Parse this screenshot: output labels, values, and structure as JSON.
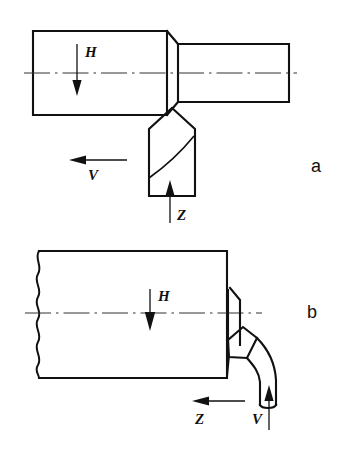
{
  "figure": {
    "kind": "technical-line-drawing",
    "background_color": "#ffffff",
    "line_color": "#111111"
  },
  "panels": [
    {
      "id": "a",
      "panel_label": "a",
      "label_position": {
        "x": 311,
        "y": 172
      },
      "description": "stepped cylindrical workpiece with cutting tool below, turning operation",
      "annotations": [
        {
          "name": "force-H",
          "label": "H",
          "direction": "down",
          "label_x": 85,
          "label_y": 57,
          "line": {
            "x1": 77,
            "y1": 44,
            "x2": 77,
            "y2": 86
          },
          "head": {
            "x": 77,
            "y": 95
          }
        },
        {
          "name": "velocity-V",
          "label": "V",
          "direction": "left",
          "label_x": 88,
          "label_y": 180,
          "line": {
            "x1": 126,
            "y1": 160,
            "x2": 84,
            "y2": 160
          },
          "head": {
            "x": 70,
            "y": 160
          }
        },
        {
          "name": "force-Z",
          "label": "Z",
          "direction": "up",
          "label_x": 177,
          "label_y": 219,
          "line": {
            "x1": 170,
            "y1": 222,
            "x2": 170,
            "y2": 193
          },
          "head": {
            "x": 170,
            "y": 181
          }
        }
      ],
      "centerline": {
        "x1": 24,
        "y1": 73,
        "x2": 297,
        "y2": 73
      }
    },
    {
      "id": "b",
      "panel_label": "b",
      "label_position": {
        "x": 307,
        "y": 318
      },
      "description": "large workpiece with break line at left and form cutting tool at right, facing operation",
      "annotations": [
        {
          "name": "force-H",
          "label": "H",
          "direction": "down",
          "label_x": 158,
          "label_y": 300,
          "line": {
            "x1": 150,
            "y1": 290,
            "x2": 150,
            "y2": 318
          },
          "head": {
            "x": 150,
            "y": 328
          }
        },
        {
          "name": "force-Z",
          "label": "Z",
          "direction": "left",
          "label_x": 196,
          "label_y": 423,
          "line": {
            "x1": 244,
            "y1": 401,
            "x2": 207,
            "y2": 401
          },
          "head": {
            "x": 193,
            "y": 401
          }
        },
        {
          "name": "velocity-V",
          "label": "V",
          "direction": "up",
          "label_x": 254,
          "label_y": 423,
          "line": {
            "x1": 269,
            "y1": 428,
            "x2": 269,
            "y2": 398
          },
          "head": {
            "x": 269,
            "y": 386
          }
        }
      ],
      "centerline": {
        "x1": 25,
        "y1": 313,
        "x2": 262,
        "y2": 313
      }
    }
  ],
  "labels": {
    "H": "H",
    "V": "V",
    "Z": "Z",
    "panel_a": "a",
    "panel_b": "b"
  }
}
